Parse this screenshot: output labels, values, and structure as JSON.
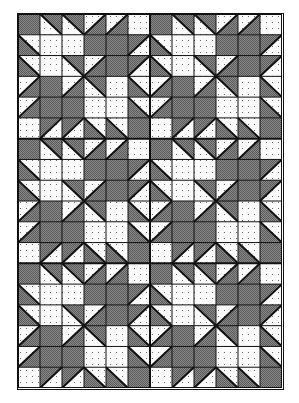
{
  "title": "Quilt block pattern — repeating star blocks",
  "quilt": {
    "columns": 12,
    "rows": 18,
    "repeat_block_size": [
      6,
      6
    ],
    "colors": {
      "dark_fill": "#8a8a8a",
      "dark_dither": "#5a5a5a",
      "light_fill": "#fafafa",
      "dot": "#6a6a6a",
      "line": "#111111"
    },
    "legend": {
      "D": "solid dark (gray dithered)",
      "L": "solid light (white dotted)",
      "BD": "backslash diagonal, upper-right dark, lower-left light",
      "BL": "backslash diagonal, upper-right light, lower-left dark",
      "SD": "slash diagonal, upper-left light, lower-right dark",
      "SL": "slash diagonal, upper-left dark, lower-right light"
    },
    "block": [
      [
        "D",
        "BD",
        "BD",
        "SD",
        "SD",
        "L"
      ],
      [
        "BL",
        "L",
        "L",
        "D",
        "D",
        "SL"
      ],
      [
        "BL",
        "L",
        "BD",
        "SD",
        "D",
        "SL"
      ],
      [
        "SD",
        "D",
        "SD",
        "BD",
        "L",
        "BL"
      ],
      [
        "SD",
        "D",
        "D",
        "L",
        "L",
        "BL"
      ],
      [
        "L",
        "SL",
        "SL",
        "BL",
        "BL",
        "D"
      ]
    ]
  }
}
